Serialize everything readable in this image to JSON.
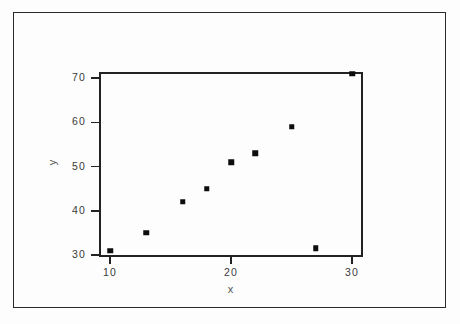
{
  "chart_data": {
    "type": "scatter",
    "title": "",
    "xlabel": "x",
    "ylabel": "y",
    "xlim": [
      9,
      31
    ],
    "ylim": [
      29,
      72
    ],
    "grid": false,
    "legend": null,
    "xticks": [
      10,
      20,
      30
    ],
    "xtick_labels": [
      "10",
      "20",
      "30"
    ],
    "yticks": [
      30,
      40,
      50,
      60,
      70
    ],
    "ytick_labels": [
      "30",
      "40",
      "50",
      "60",
      "70"
    ],
    "marker": "square",
    "marker_color": "#0d0d0d",
    "points": [
      {
        "x": 10,
        "y": 31
      },
      {
        "x": 13,
        "y": 35
      },
      {
        "x": 16,
        "y": 42
      },
      {
        "x": 18,
        "y": 45
      },
      {
        "x": 20,
        "y": 51
      },
      {
        "x": 22,
        "y": 53
      },
      {
        "x": 25,
        "y": 59
      },
      {
        "x": 27,
        "y": 31.5
      },
      {
        "x": 30,
        "y": 71
      }
    ]
  }
}
